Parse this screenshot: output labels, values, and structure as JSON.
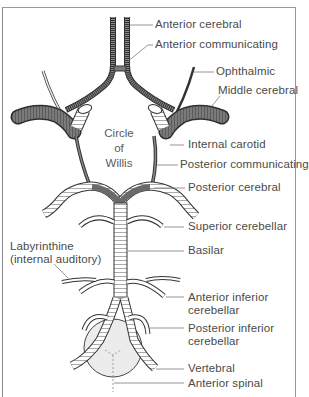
{
  "diagram": {
    "center_label": [
      "Circle",
      "of",
      "Willis"
    ],
    "labels": {
      "anterior_cerebral": "Anterior cerebral",
      "anterior_communicating": "Anterior communicating",
      "ophthalmic": "Ophthalmic",
      "middle_cerebral": "Middle cerebral",
      "internal_carotid": "Internal carotid",
      "posterior_communicating": "Posterior communicating",
      "posterior_cerebral": "Posterior cerebral",
      "superior_cerebellar": "Superior cerebellar",
      "labyrinthine_1": "Labyrinthine",
      "labyrinthine_2": "(internal auditory)",
      "basilar": "Basilar",
      "anterior_inferior_cerebellar_1": "Anterior inferior",
      "anterior_inferior_cerebellar_2": "cerebellar",
      "posterior_inferior_cerebellar_1": "Posterior inferior",
      "posterior_inferior_cerebellar_2": "cerebellar",
      "vertebral": "Vertebral",
      "anterior_spinal": "Anterior spinal"
    },
    "colors": {
      "vessel_dark": "#6e6e6e",
      "vessel_light": "#ffffff",
      "outline": "#3a3a3a",
      "leader": "#7a7a7a",
      "medulla_fill": "#ececec",
      "text": "#4a4a4a"
    }
  }
}
